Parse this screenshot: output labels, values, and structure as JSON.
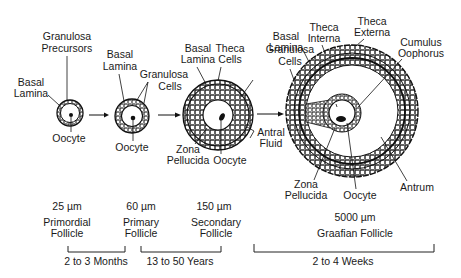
{
  "stages": [
    {
      "size": "25 µm",
      "name_line1": "Primordial",
      "name_line2": "Follicle"
    },
    {
      "size": "60 µm",
      "name_line1": "Primary",
      "name_line2": "Follicle"
    },
    {
      "size": "150 µm",
      "name_line1": "Secondary",
      "name_line2": "Follicle"
    },
    {
      "size": "5000 µm",
      "name_line1": "Graafian Follicle",
      "name_line2": ""
    }
  ],
  "durations": [
    {
      "label": "2 to 3 Months"
    },
    {
      "label": "13 to 50 Years"
    },
    {
      "label": "2 to 4 Weeks"
    }
  ],
  "labels": {
    "primordial": {
      "granulosa_precursors_1": "Granulosa",
      "granulosa_precursors_2": "Precursors",
      "basal_lamina_1": "Basal",
      "basal_lamina_2": "Lamina",
      "oocyte": "Oocyte"
    },
    "primary": {
      "basal_lamina_1": "Basal",
      "basal_lamina_2": "Lamina",
      "granulosa_cells_1": "Granulosa",
      "granulosa_cells_2": "Cells",
      "oocyte": "Oocyte"
    },
    "secondary": {
      "basal_lamina_1": "Basal",
      "basal_lamina_2": "Lamina",
      "theca_cells_1": "Theca",
      "theca_cells_2": "Cells",
      "zona_pellucida_1": "Zona",
      "zona_pellucida_2": "Pellucida",
      "oocyte": "Oocyte"
    },
    "graafian": {
      "granulosa_cells_1": "Granulosa",
      "granulosa_cells_2": "Cells",
      "basal_lamina_1": "Basal",
      "basal_lamina_2": "Lamina",
      "theca_interna_1": "Theca",
      "theca_interna_2": "Interna",
      "theca_externa_1": "Theca",
      "theca_externa_2": "Externa",
      "cumulus_oophorus_1": "Cumulus",
      "cumulus_oophorus_2": "Oophorus",
      "antral_fluid_1": "Antral",
      "antral_fluid_2": "Fluid",
      "zona_pellucida_1": "Zona",
      "zona_pellucida_2": "Pellucida",
      "oocyte": "Oocyte",
      "antrum": "Antrum"
    }
  }
}
